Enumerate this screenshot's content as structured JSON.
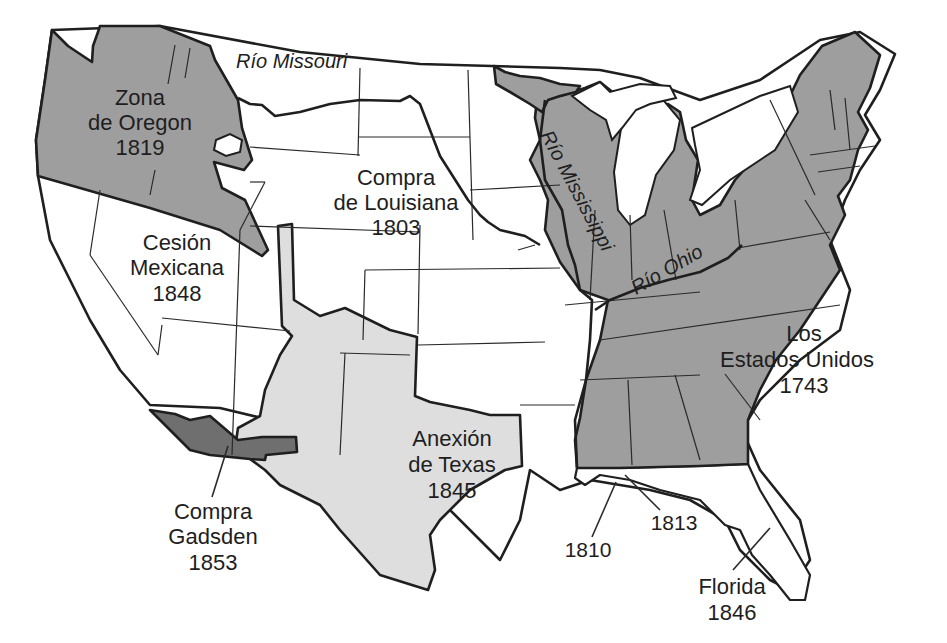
{
  "map": {
    "colors": {
      "original_us": "#9e9e9e",
      "texas_annexation": "#dedede",
      "gadsden_purchase": "#6f6f6f",
      "unshaded": "#ffffff",
      "border": "#1f1f1f"
    },
    "regions": {
      "oregon": {
        "line1": "Zona",
        "line2": "de Oregon",
        "year": "1819"
      },
      "louisiana": {
        "line1": "Compra",
        "line2": "de Louisiana",
        "year": "1803"
      },
      "mexican_cession": {
        "line1": "Cesión",
        "line2": "Mexicana",
        "year": "1848"
      },
      "texas": {
        "line1": "Anexión",
        "line2": "de Texas",
        "year": "1845"
      },
      "gadsden": {
        "line1": "Compra",
        "line2": "Gadsden",
        "year": "1853"
      },
      "united_states": {
        "line1": "Los",
        "line2": "Estados Unidos",
        "year": "1743"
      },
      "florida": {
        "line1": "Florida",
        "year": "1846"
      },
      "west_florida_1810": {
        "year": "1810"
      },
      "west_florida_1813": {
        "year": "1813"
      }
    },
    "rivers": {
      "missouri": "Río Missouri",
      "mississippi": "Río Mississippi",
      "ohio": "Río Ohio"
    }
  }
}
